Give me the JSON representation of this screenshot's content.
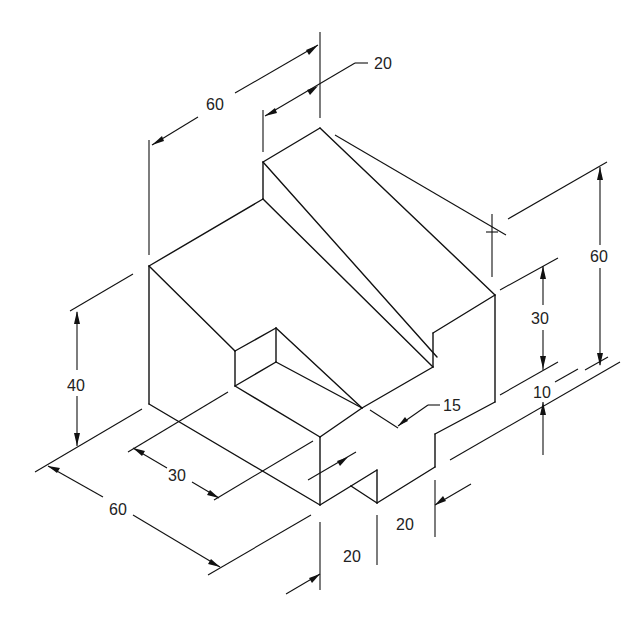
{
  "drawing": {
    "type": "isometric-engineering-drawing",
    "dimensions": {
      "top_width": "60",
      "top_step": "20",
      "total_height": "60",
      "right_height": "30",
      "step_height": "10",
      "slot_depth": "15",
      "left_height": "40",
      "notch_width": "30",
      "base_length": "60",
      "front_foot_width": "20",
      "right_foot_width": "20"
    },
    "colors": {
      "line": "#111111",
      "background": "#ffffff"
    }
  }
}
